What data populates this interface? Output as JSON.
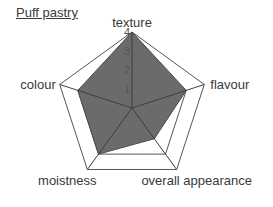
{
  "chart_data": {
    "type": "radar",
    "title": "Puff pastry",
    "categories": [
      "texture",
      "flavour",
      "overall appearance",
      "moistness",
      "colour"
    ],
    "series": [
      {
        "name": "Puff pastry",
        "values": [
          4,
          3,
          2,
          3,
          3
        ],
        "color": "#6b6b6b"
      }
    ],
    "rlim": [
      0,
      4
    ],
    "tick_labels": [
      "1",
      "2",
      "3",
      "4"
    ],
    "grid": true,
    "legend": "none"
  },
  "colors": {
    "fill": "#6b6b6b",
    "grid": "#555555",
    "text": "#3a3a3a"
  }
}
